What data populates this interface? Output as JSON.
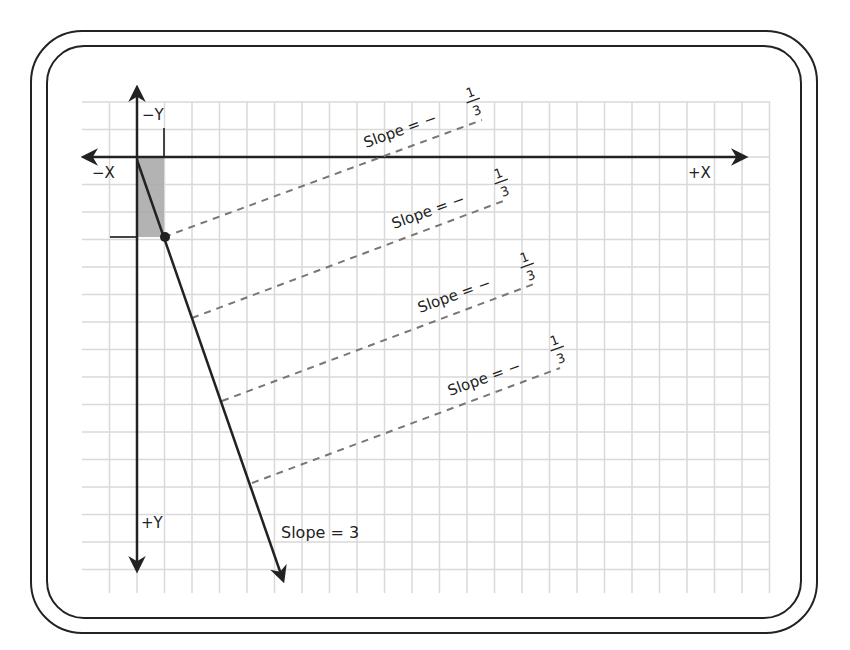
{
  "diagram": {
    "title": "",
    "axes": {
      "neg_x_label": "−X",
      "pos_x_label": "+X",
      "neg_y_label": "−Y",
      "pos_y_label": "+Y"
    },
    "main_line": {
      "label": "Slope = 3",
      "slope": 3
    },
    "perpendicular_lines": [
      {
        "label_prefix": "Slope = −",
        "numerator": "1",
        "denominator": "3"
      },
      {
        "label_prefix": "Slope = −",
        "numerator": "1",
        "denominator": "3"
      },
      {
        "label_prefix": "Slope = −",
        "numerator": "1",
        "denominator": "3"
      },
      {
        "label_prefix": "Slope = −",
        "numerator": "1",
        "denominator": "3"
      }
    ],
    "colors": {
      "grid": "#d9d9d9",
      "axis": "#222222",
      "dash": "#777777",
      "shade": "#a6a6a6"
    }
  }
}
